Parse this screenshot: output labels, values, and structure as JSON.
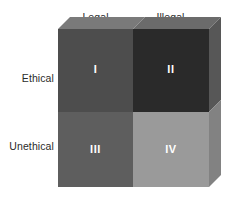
{
  "figure": {
    "columns": [
      {
        "label": "Legal"
      },
      {
        "label": "Illegal"
      }
    ],
    "rows": [
      {
        "label": "Ethical"
      },
      {
        "label": "Unethical"
      }
    ],
    "quadrants": [
      {
        "numeral": "I",
        "row": "Ethical",
        "column": "Legal",
        "fill": "#4d4d4d"
      },
      {
        "numeral": "II",
        "row": "Ethical",
        "column": "Illegal",
        "fill": "#2a2a2a"
      },
      {
        "numeral": "III",
        "row": "Unethical",
        "column": "Legal",
        "fill": "#5e5e5e"
      },
      {
        "numeral": "IV",
        "row": "Unethical",
        "column": "Illegal",
        "fill": "#9a9a9a"
      }
    ],
    "shading": {
      "top_bevel_left": "#7a7a7a",
      "top_bevel_right": "#6b6b6b",
      "side_upper": "#575757",
      "side_lower": "#828282",
      "numeral_color": "#ffffff",
      "label_color": "#2b2b2b",
      "background": "#ffffff"
    }
  }
}
